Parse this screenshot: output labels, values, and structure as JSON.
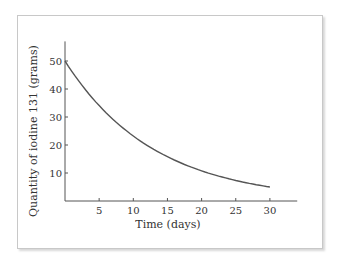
{
  "chart_data": {
    "type": "line",
    "title": "",
    "xlabel": "Time (days)",
    "ylabel": "Quantity of iodine 131 (grams)",
    "xlim": [
      0,
      34
    ],
    "ylim": [
      0,
      57
    ],
    "x_ticks": [
      5,
      10,
      15,
      20,
      25,
      30
    ],
    "y_ticks": [
      10,
      20,
      30,
      40,
      50
    ],
    "grid": false,
    "legend": null,
    "series": [
      {
        "name": "Iodine 131 remaining",
        "color": "#555555",
        "x": [
          0,
          2,
          4,
          6,
          8,
          10,
          12,
          14,
          16,
          18,
          20,
          22,
          24,
          26,
          28,
          30
        ],
        "values": [
          50,
          42.9,
          36.8,
          31.5,
          27.1,
          23.2,
          19.9,
          17.1,
          14.6,
          12.6,
          10.8,
          9.2,
          7.9,
          6.8,
          5.8,
          5.0
        ]
      }
    ]
  }
}
